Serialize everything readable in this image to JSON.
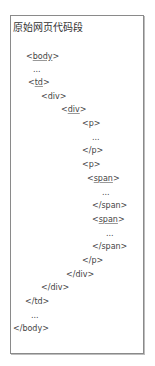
{
  "title": "原始网页代码段",
  "code_lines": [
    {
      "pre": "<",
      "tag": "body",
      "post": ">",
      "underline": true
    },
    {
      "text": "..."
    },
    {
      "pre": "<",
      "tag": "td",
      "post": ">",
      "underline": true
    },
    {
      "text": "<div>"
    },
    {
      "pre": "<",
      "tag": "div",
      "post": ">",
      "underline": true
    },
    {
      "text": "<p>"
    },
    {
      "text": "..."
    },
    {
      "text": "</p>"
    },
    {
      "text": "<p>"
    },
    {
      "pre": "<",
      "tag": "span",
      "post": ">",
      "underline": true
    },
    {
      "text": "..."
    },
    {
      "text": "</span>"
    },
    {
      "pre": "<",
      "tag": "span",
      "post": ">",
      "underline": true
    },
    {
      "text": "..."
    },
    {
      "text": "</span>"
    },
    {
      "text": "</p>"
    },
    {
      "text": "</div>"
    },
    {
      "text": "</div>"
    },
    {
      "text": "</td>"
    },
    {
      "text": "..."
    },
    {
      "text": "</body>"
    }
  ]
}
